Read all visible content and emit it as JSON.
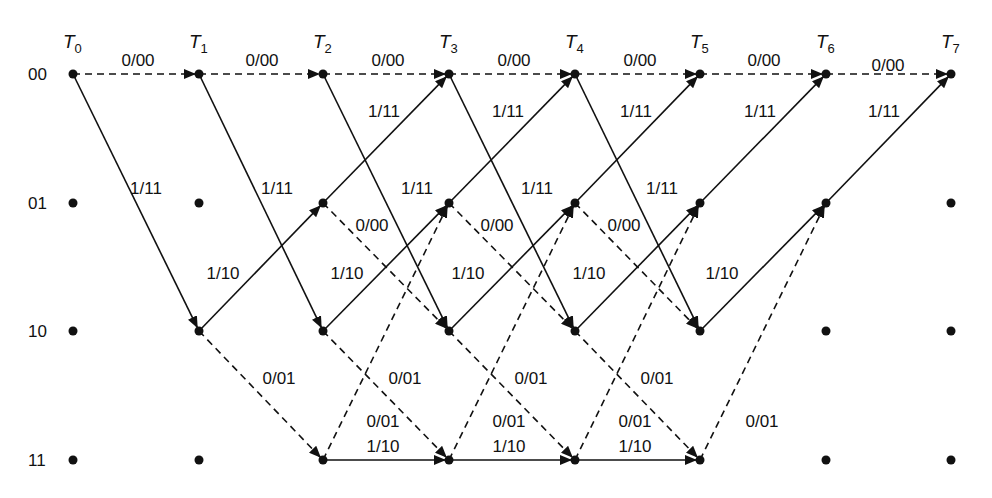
{
  "diagram": {
    "type": "trellis",
    "colors": {
      "ink": "#111111",
      "background": "#ffffff"
    },
    "time_labels": [
      "T0",
      "T1",
      "T2",
      "T3",
      "T4",
      "T5",
      "T6",
      "T7"
    ],
    "time_label_parts": [
      {
        "main": "T",
        "sub": "0"
      },
      {
        "main": "T",
        "sub": "1"
      },
      {
        "main": "T",
        "sub": "2"
      },
      {
        "main": "T",
        "sub": "3"
      },
      {
        "main": "T",
        "sub": "4"
      },
      {
        "main": "T",
        "sub": "5"
      },
      {
        "main": "T",
        "sub": "6"
      },
      {
        "main": "T",
        "sub": "7"
      }
    ],
    "states": [
      "00",
      "01",
      "10",
      "11"
    ],
    "legend": {
      "solid": "input 1",
      "dashed": "input 0"
    },
    "branch_labels": {
      "s00_to_s00": "0/00",
      "s00_to_s10": "1/11",
      "s01_to_s00": "1/11",
      "s01_to_s10": "0/00",
      "s10_to_s01": "1/10",
      "s10_to_s11": "0/01",
      "s11_to_s01": "0/01",
      "s11_to_s11": "1/10"
    },
    "edges": [
      {
        "t": 0,
        "from": "00",
        "to": "00",
        "style": "dashed",
        "label": "0/00"
      },
      {
        "t": 0,
        "from": "00",
        "to": "10",
        "style": "solid",
        "label": "1/11"
      },
      {
        "t": 1,
        "from": "00",
        "to": "00",
        "style": "dashed",
        "label": "0/00"
      },
      {
        "t": 1,
        "from": "00",
        "to": "10",
        "style": "solid",
        "label": "1/11"
      },
      {
        "t": 1,
        "from": "10",
        "to": "01",
        "style": "solid",
        "label": "1/10"
      },
      {
        "t": 1,
        "from": "10",
        "to": "11",
        "style": "dashed",
        "label": "0/01"
      },
      {
        "t": 2,
        "from": "00",
        "to": "00",
        "style": "dashed",
        "label": "0/00"
      },
      {
        "t": 2,
        "from": "00",
        "to": "10",
        "style": "solid",
        "label": "1/11"
      },
      {
        "t": 2,
        "from": "01",
        "to": "00",
        "style": "solid",
        "label": "1/11"
      },
      {
        "t": 2,
        "from": "01",
        "to": "10",
        "style": "dashed",
        "label": "0/00"
      },
      {
        "t": 2,
        "from": "10",
        "to": "01",
        "style": "solid",
        "label": "1/10"
      },
      {
        "t": 2,
        "from": "10",
        "to": "11",
        "style": "dashed",
        "label": "0/01"
      },
      {
        "t": 2,
        "from": "11",
        "to": "01",
        "style": "dashed",
        "label": "0/01"
      },
      {
        "t": 2,
        "from": "11",
        "to": "11",
        "style": "solid",
        "label": "1/10"
      },
      {
        "t": 3,
        "from": "00",
        "to": "00",
        "style": "dashed",
        "label": "0/00"
      },
      {
        "t": 3,
        "from": "00",
        "to": "10",
        "style": "solid",
        "label": "1/11"
      },
      {
        "t": 3,
        "from": "01",
        "to": "00",
        "style": "solid",
        "label": "1/11"
      },
      {
        "t": 3,
        "from": "01",
        "to": "10",
        "style": "dashed",
        "label": "0/00"
      },
      {
        "t": 3,
        "from": "10",
        "to": "01",
        "style": "solid",
        "label": "1/10"
      },
      {
        "t": 3,
        "from": "10",
        "to": "11",
        "style": "dashed",
        "label": "0/01"
      },
      {
        "t": 3,
        "from": "11",
        "to": "01",
        "style": "dashed",
        "label": "0/01"
      },
      {
        "t": 3,
        "from": "11",
        "to": "11",
        "style": "solid",
        "label": "1/10"
      },
      {
        "t": 4,
        "from": "00",
        "to": "00",
        "style": "dashed",
        "label": "0/00"
      },
      {
        "t": 4,
        "from": "00",
        "to": "10",
        "style": "solid",
        "label": "1/11"
      },
      {
        "t": 4,
        "from": "01",
        "to": "00",
        "style": "solid",
        "label": "1/11"
      },
      {
        "t": 4,
        "from": "01",
        "to": "10",
        "style": "dashed",
        "label": "0/00"
      },
      {
        "t": 4,
        "from": "10",
        "to": "01",
        "style": "solid",
        "label": "1/10"
      },
      {
        "t": 4,
        "from": "10",
        "to": "11",
        "style": "dashed",
        "label": "0/01"
      },
      {
        "t": 4,
        "from": "11",
        "to": "01",
        "style": "dashed",
        "label": "0/01"
      },
      {
        "t": 4,
        "from": "11",
        "to": "11",
        "style": "solid",
        "label": "1/10"
      },
      {
        "t": 5,
        "from": "00",
        "to": "00",
        "style": "dashed",
        "label": "0/00"
      },
      {
        "t": 5,
        "from": "01",
        "to": "00",
        "style": "solid",
        "label": "1/11"
      },
      {
        "t": 5,
        "from": "10",
        "to": "01",
        "style": "solid",
        "label": "1/10"
      },
      {
        "t": 5,
        "from": "11",
        "to": "01",
        "style": "dashed",
        "label": "0/01"
      },
      {
        "t": 6,
        "from": "00",
        "to": "00",
        "style": "dashed",
        "label": "0/00"
      },
      {
        "t": 6,
        "from": "01",
        "to": "00",
        "style": "solid",
        "label": "1/11"
      }
    ],
    "text_labels": [
      {
        "text": "0/00",
        "x": 138,
        "y": 66
      },
      {
        "text": "0/00",
        "x": 262,
        "y": 66
      },
      {
        "text": "0/00",
        "x": 388,
        "y": 66
      },
      {
        "text": "0/00",
        "x": 514,
        "y": 66
      },
      {
        "text": "0/00",
        "x": 640,
        "y": 66
      },
      {
        "text": "0/00",
        "x": 764,
        "y": 66
      },
      {
        "text": "0/00",
        "x": 888,
        "y": 71
      },
      {
        "text": "1/11",
        "x": 384,
        "y": 117
      },
      {
        "text": "1/11",
        "x": 508,
        "y": 117
      },
      {
        "text": "1/11",
        "x": 636,
        "y": 117
      },
      {
        "text": "1/11",
        "x": 760,
        "y": 117
      },
      {
        "text": "1/11",
        "x": 884,
        "y": 117
      },
      {
        "text": "1/11",
        "x": 146,
        "y": 194
      },
      {
        "text": "1/11",
        "x": 277,
        "y": 194
      },
      {
        "text": "1/11",
        "x": 417,
        "y": 194
      },
      {
        "text": "1/11",
        "x": 537,
        "y": 194
      },
      {
        "text": "1/11",
        "x": 662,
        "y": 194
      },
      {
        "text": "0/00",
        "x": 372,
        "y": 231
      },
      {
        "text": "0/00",
        "x": 497,
        "y": 231
      },
      {
        "text": "0/00",
        "x": 624,
        "y": 231
      },
      {
        "text": "1/10",
        "x": 223,
        "y": 279
      },
      {
        "text": "1/10",
        "x": 347,
        "y": 279
      },
      {
        "text": "1/10",
        "x": 468,
        "y": 279
      },
      {
        "text": "1/10",
        "x": 589,
        "y": 279
      },
      {
        "text": "1/10",
        "x": 722,
        "y": 279
      },
      {
        "text": "0/01",
        "x": 279,
        "y": 384
      },
      {
        "text": "0/01",
        "x": 405,
        "y": 384
      },
      {
        "text": "0/01",
        "x": 531,
        "y": 384
      },
      {
        "text": "0/01",
        "x": 657,
        "y": 384
      },
      {
        "text": "0/01",
        "x": 383,
        "y": 427
      },
      {
        "text": "0/01",
        "x": 509,
        "y": 427
      },
      {
        "text": "0/01",
        "x": 635,
        "y": 427
      },
      {
        "text": "0/01",
        "x": 762,
        "y": 427
      },
      {
        "text": "1/10",
        "x": 383,
        "y": 452
      },
      {
        "text": "1/10",
        "x": 509,
        "y": 452
      },
      {
        "text": "1/10",
        "x": 635,
        "y": 452
      }
    ]
  }
}
